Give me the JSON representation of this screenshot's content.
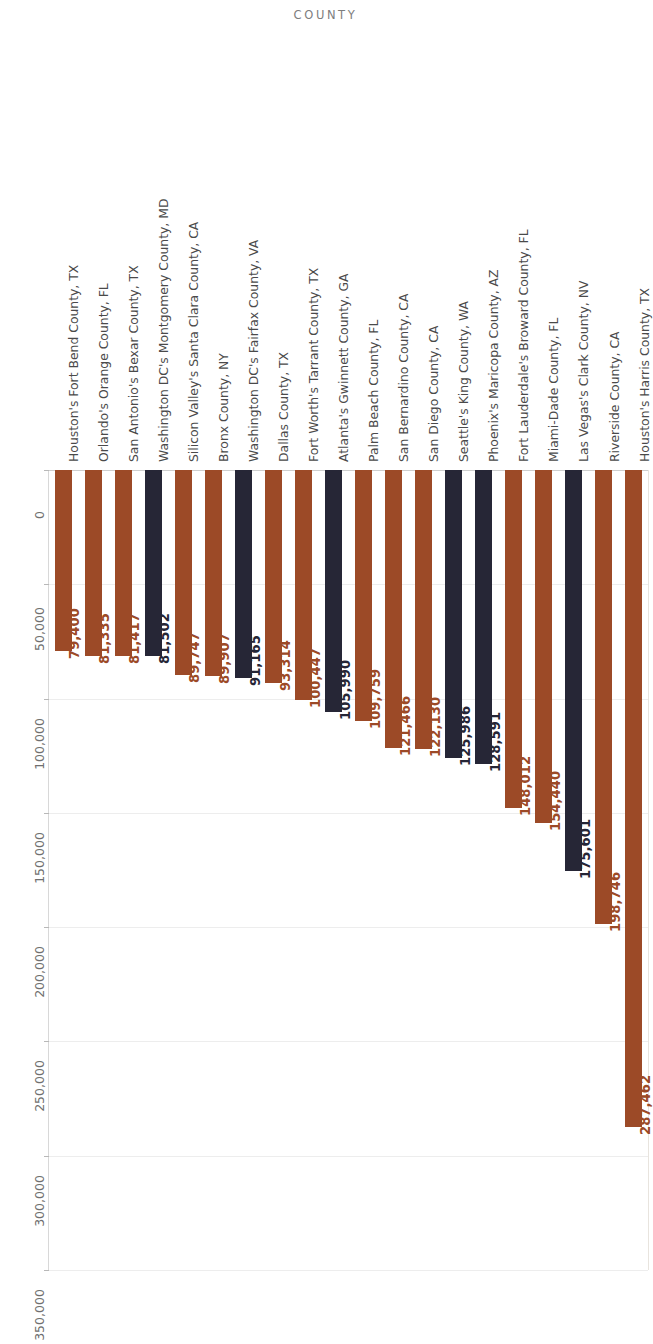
{
  "chart": {
    "title": "COUNTY"
  },
  "axis": {
    "ticks": [
      "0",
      "50,000",
      "100,000",
      "150,000",
      "200,000",
      "250,000",
      "300,000",
      "350,000"
    ],
    "tick_values": [
      0,
      50000,
      100000,
      150000,
      200000,
      250000,
      300000,
      350000
    ]
  },
  "colors": {
    "brown": "#9c4a27",
    "navy": "#262636",
    "title": "#7d7d7d",
    "category_label": "#4a4a4a",
    "tick_label": "#6f6f6f",
    "gridline": "#ededed",
    "background": "#ffffff"
  },
  "chart_data": {
    "type": "bar",
    "title": "COUNTY",
    "xlabel": "",
    "ylabel": "",
    "ylim": [
      0,
      350000
    ],
    "grid": true,
    "orientation": "vertical-rotated",
    "legend": "none",
    "categories": [
      "Houston's Harris County, TX",
      "Riverside County, CA",
      "Las Vegas's Clark County, NV",
      "Miami-Dade County, FL",
      "Fort Lauderdale's Broward County, FL",
      "Phoenix's Maricopa County, AZ",
      "Seattle's King County, WA",
      "San Diego County, CA",
      "San Bernardino County, CA",
      "Palm Beach County, FL",
      "Atlanta's Gwinnett County, GA",
      "Fort Worth's Tarrant County, TX",
      "Dallas County, TX",
      "Washington DC's Fairfax County, VA",
      "Bronx County, NY",
      "Silicon Valley's Santa Clara County, CA",
      "Washington DC's Montgomery County, MD",
      "San Antonio's Bexar County, TX",
      "Orlando's Orange County, FL",
      "Houston's Fort Bend County, TX"
    ],
    "values": [
      287462,
      198746,
      175601,
      154440,
      148012,
      128591,
      125986,
      122130,
      121466,
      109759,
      105990,
      100447,
      93314,
      91165,
      89907,
      89747,
      81502,
      81417,
      81335,
      79400
    ],
    "value_labels": [
      "287,462",
      "198,746",
      "175,601",
      "154,440",
      "148,012",
      "128,591",
      "125,986",
      "122,130",
      "121,466",
      "109,759",
      "105,990",
      "100,447",
      "93,314",
      "91,165",
      "89,907",
      "89,747",
      "81,502",
      "81,417",
      "81,335",
      "79,400"
    ],
    "bar_colors": [
      "brown",
      "brown",
      "navy",
      "brown",
      "brown",
      "navy",
      "navy",
      "brown",
      "brown",
      "brown",
      "navy",
      "brown",
      "brown",
      "navy",
      "brown",
      "brown",
      "navy",
      "brown",
      "brown",
      "brown"
    ]
  }
}
